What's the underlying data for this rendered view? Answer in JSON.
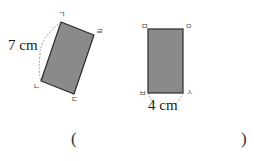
{
  "figures": {
    "left_rectangle": {
      "vertices": {
        "top": "ㄱ",
        "right": "ㄹ",
        "bottom": "ㄷ",
        "left": "ㄴ"
      },
      "side_label": "7 cm",
      "fill_color": "#8a8a8a",
      "stroke_color": "#2a2a2a"
    },
    "right_rectangle": {
      "vertices": {
        "top_left": "ㅁ",
        "top_right": "ㅇ",
        "bottom_left": "ㅂ",
        "bottom_right": "ㅅ"
      },
      "side_label": "4 cm",
      "fill_color": "#8a8a8a",
      "stroke_color": "#2a2a2a"
    }
  },
  "answer": {
    "open_paren": "(",
    "close_paren": ")",
    "value": ""
  }
}
